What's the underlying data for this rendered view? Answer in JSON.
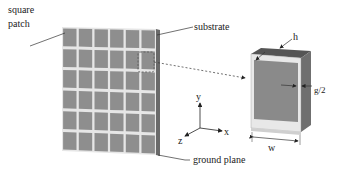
{
  "labels": {
    "square_patch_line1": "square",
    "square_patch_line2": "patch",
    "substrate": "substrate",
    "ground_plane": "ground plane",
    "h": "h",
    "g2": "g/2",
    "w": "w",
    "axis_x": "x",
    "axis_y": "y",
    "axis_z": "z"
  },
  "array": {
    "rows": 6,
    "cols": 6
  },
  "colors": {
    "patch": "#8e8e8e",
    "gap": "#e6e6e6",
    "substrate_edge": "#6a6a6a",
    "unit_top": "#555555",
    "unit_side": "#6f6f6f",
    "unit_face": "#8a8a8a",
    "unit_rim": "#e8e8e8",
    "line": "#333333"
  }
}
